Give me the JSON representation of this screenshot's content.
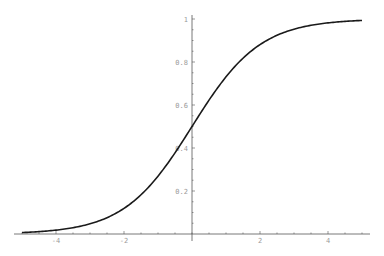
{
  "chart_data": {
    "type": "line",
    "title": "",
    "xlabel": "",
    "ylabel": "",
    "function": "1/(1+e^(-x))",
    "xlim": [
      -5,
      5
    ],
    "ylim": [
      0,
      1
    ],
    "grid": false,
    "legend": null,
    "x_ticks": [
      -4,
      -2,
      2,
      4
    ],
    "x_tick_labels": [
      "-4",
      "-2",
      "2",
      "4"
    ],
    "y_ticks": [
      0.2,
      0.4,
      0.6,
      0.8,
      1
    ],
    "y_tick_labels": [
      "0.2",
      "0.4",
      "0.6",
      "0.8",
      "1"
    ],
    "series": [
      {
        "name": "sigmoid",
        "x": [
          -5,
          -4,
          -3,
          -2,
          -1,
          0,
          1,
          2,
          3,
          4,
          5
        ],
        "values": [
          0.007,
          0.018,
          0.047,
          0.119,
          0.269,
          0.5,
          0.731,
          0.881,
          0.953,
          0.982,
          0.993
        ]
      }
    ]
  },
  "colors": {
    "curve": "#1a1a1a",
    "axis": "#555555",
    "labels": "#9a9a9a",
    "background": "#ffffff"
  }
}
